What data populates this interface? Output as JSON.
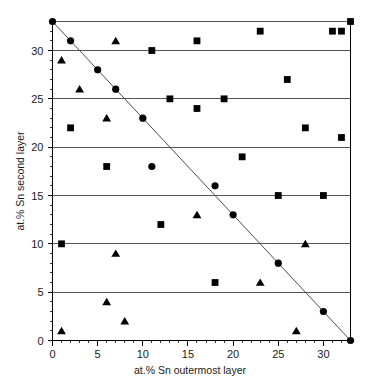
{
  "chart_data": {
    "type": "scatter",
    "title": "",
    "xlabel": "at.% Sn outermost layer",
    "ylabel": "at.% Sn second layer",
    "xlim": [
      0,
      33
    ],
    "ylim": [
      0,
      33
    ],
    "xticks": [
      0,
      5,
      10,
      15,
      20,
      25,
      30
    ],
    "yticks": [
      0,
      5,
      10,
      15,
      20,
      25,
      30
    ],
    "xtick_labels": [
      "0",
      "5",
      "10",
      "15",
      "20",
      "25",
      "30"
    ],
    "ytick_labels": [
      "0",
      "5",
      "10",
      "15",
      "20",
      "25",
      "30"
    ],
    "grid": "horizontal",
    "legend": "none",
    "series": [
      {
        "name": "circles",
        "marker": "circle",
        "color": "#000000",
        "points": [
          {
            "x": 0,
            "y": 33
          },
          {
            "x": 2,
            "y": 31
          },
          {
            "x": 5,
            "y": 28
          },
          {
            "x": 7,
            "y": 26
          },
          {
            "x": 10,
            "y": 23
          },
          {
            "x": 11,
            "y": 18
          },
          {
            "x": 18,
            "y": 16
          },
          {
            "x": 20,
            "y": 13
          },
          {
            "x": 25,
            "y": 8
          },
          {
            "x": 30,
            "y": 3
          },
          {
            "x": 33,
            "y": 0
          }
        ]
      },
      {
        "name": "squares",
        "marker": "square",
        "color": "#000000",
        "points": [
          {
            "x": 1,
            "y": 10
          },
          {
            "x": 2,
            "y": 22
          },
          {
            "x": 6,
            "y": 18
          },
          {
            "x": 11,
            "y": 30
          },
          {
            "x": 12,
            "y": 12
          },
          {
            "x": 13,
            "y": 25
          },
          {
            "x": 16,
            "y": 24
          },
          {
            "x": 16,
            "y": 31
          },
          {
            "x": 18,
            "y": 6
          },
          {
            "x": 19,
            "y": 25
          },
          {
            "x": 21,
            "y": 19
          },
          {
            "x": 23,
            "y": 32
          },
          {
            "x": 25,
            "y": 15
          },
          {
            "x": 26,
            "y": 27
          },
          {
            "x": 28,
            "y": 22
          },
          {
            "x": 30,
            "y": 15
          },
          {
            "x": 31,
            "y": 32
          },
          {
            "x": 32,
            "y": 21
          },
          {
            "x": 32,
            "y": 32
          },
          {
            "x": 33,
            "y": 33
          }
        ]
      },
      {
        "name": "triangles",
        "marker": "triangle",
        "color": "#000000",
        "points": [
          {
            "x": 1,
            "y": 1
          },
          {
            "x": 1,
            "y": 29
          },
          {
            "x": 3,
            "y": 26
          },
          {
            "x": 6,
            "y": 4
          },
          {
            "x": 6,
            "y": 23
          },
          {
            "x": 7,
            "y": 9
          },
          {
            "x": 7,
            "y": 31
          },
          {
            "x": 8,
            "y": 2
          },
          {
            "x": 16,
            "y": 13
          },
          {
            "x": 23,
            "y": 6
          },
          {
            "x": 27,
            "y": 1
          },
          {
            "x": 28,
            "y": 10
          }
        ]
      }
    ],
    "trend_line": {
      "name": "anti-diagonal-reference-line",
      "from": {
        "x": 0,
        "y": 33
      },
      "to": {
        "x": 33,
        "y": 0
      },
      "color": "#4d4d4d"
    }
  }
}
